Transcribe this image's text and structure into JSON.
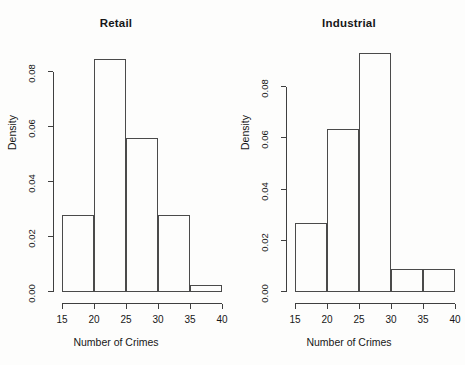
{
  "figure": {
    "background_color": "#fdfdfc",
    "axis_color": "#3f3f3f",
    "bar_border_color": "#4a4a4a"
  },
  "chart_data": [
    {
      "type": "bar",
      "title": "Retail",
      "xlabel": "Number of Crimes",
      "ylabel": "Density",
      "categories": [
        "15-20",
        "20-25",
        "25-30",
        "30-35",
        "35-40"
      ],
      "bin_edges": [
        15,
        20,
        25,
        30,
        35,
        40
      ],
      "values": [
        0.028,
        0.085,
        0.056,
        0.028,
        0.0025
      ],
      "xlim": [
        15,
        40
      ],
      "ylim": [
        0,
        0.09
      ],
      "xticks": [
        15,
        20,
        25,
        30,
        35,
        40
      ],
      "xtick_labels": [
        "15",
        "20",
        "25",
        "30",
        "35",
        "40"
      ],
      "yticks": [
        0.0,
        0.02,
        0.04,
        0.06,
        0.08
      ],
      "ytick_labels": [
        "0.00",
        "0.02",
        "0.04",
        "0.06",
        "0.08"
      ],
      "grid": false,
      "legend": "none"
    },
    {
      "type": "bar",
      "title": "Industrial",
      "xlabel": "Number of Crimes",
      "ylabel": "Density",
      "categories": [
        "15-20",
        "20-25",
        "25-30",
        "30-35",
        "35-40"
      ],
      "bin_edges": [
        15,
        20,
        25,
        30,
        35,
        40
      ],
      "values": [
        0.027,
        0.0635,
        0.0935,
        0.009,
        0.009
      ],
      "xlim": [
        15,
        40
      ],
      "ylim": [
        0,
        0.0965
      ],
      "xticks": [
        15,
        20,
        25,
        30,
        35,
        40
      ],
      "xtick_labels": [
        "15",
        "20",
        "25",
        "30",
        "35",
        "40"
      ],
      "yticks": [
        0.0,
        0.02,
        0.04,
        0.06,
        0.08
      ],
      "ytick_labels": [
        "0.00",
        "0.02",
        "0.04",
        "0.06",
        "0.08"
      ],
      "grid": false,
      "legend": "none"
    }
  ]
}
